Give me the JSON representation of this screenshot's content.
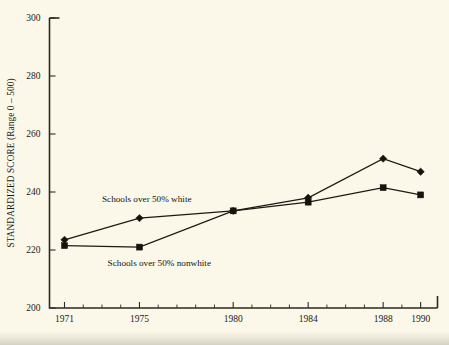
{
  "chart_data": {
    "type": "line",
    "title": "",
    "subtitle": "",
    "xlabel": "",
    "ylabel": "STANDARDIZED SCORE (Range 0 – 500)",
    "categories": [
      "1971",
      "1975",
      "1980",
      "1984",
      "1988",
      "1990"
    ],
    "x": [
      1971,
      1975,
      1980,
      1984,
      1988,
      1990
    ],
    "ylim": [
      200,
      300
    ],
    "yticks": [
      200,
      220,
      240,
      260,
      280,
      300
    ],
    "ytick_labels": [
      "200",
      "220",
      "240",
      "260",
      "280",
      "300"
    ],
    "xtick_labels": [
      "1971",
      "1975",
      "1980",
      "1984",
      "1988",
      "1990"
    ],
    "grid": false,
    "legend_position": "inline-annotation",
    "series": [
      {
        "name": "Schools over 50% white",
        "marker": "diamond",
        "values": [
          223.5,
          231,
          233.5,
          238,
          251.5,
          247
        ]
      },
      {
        "name": "Schools over 50% nonwhite",
        "marker": "square",
        "values": [
          221.5,
          221,
          233.5,
          236.5,
          241.5,
          239
        ]
      }
    ],
    "annotations": [
      {
        "text": "Schools over 50% white",
        "x": 1973.0,
        "y": 236.5
      },
      {
        "text": "Schools over 50% nonwhite",
        "x": 1973.3,
        "y": 214.5
      }
    ],
    "colors": {
      "background": "#fbf8ea",
      "ink": "#1a1a14",
      "series": "#14130c"
    }
  }
}
